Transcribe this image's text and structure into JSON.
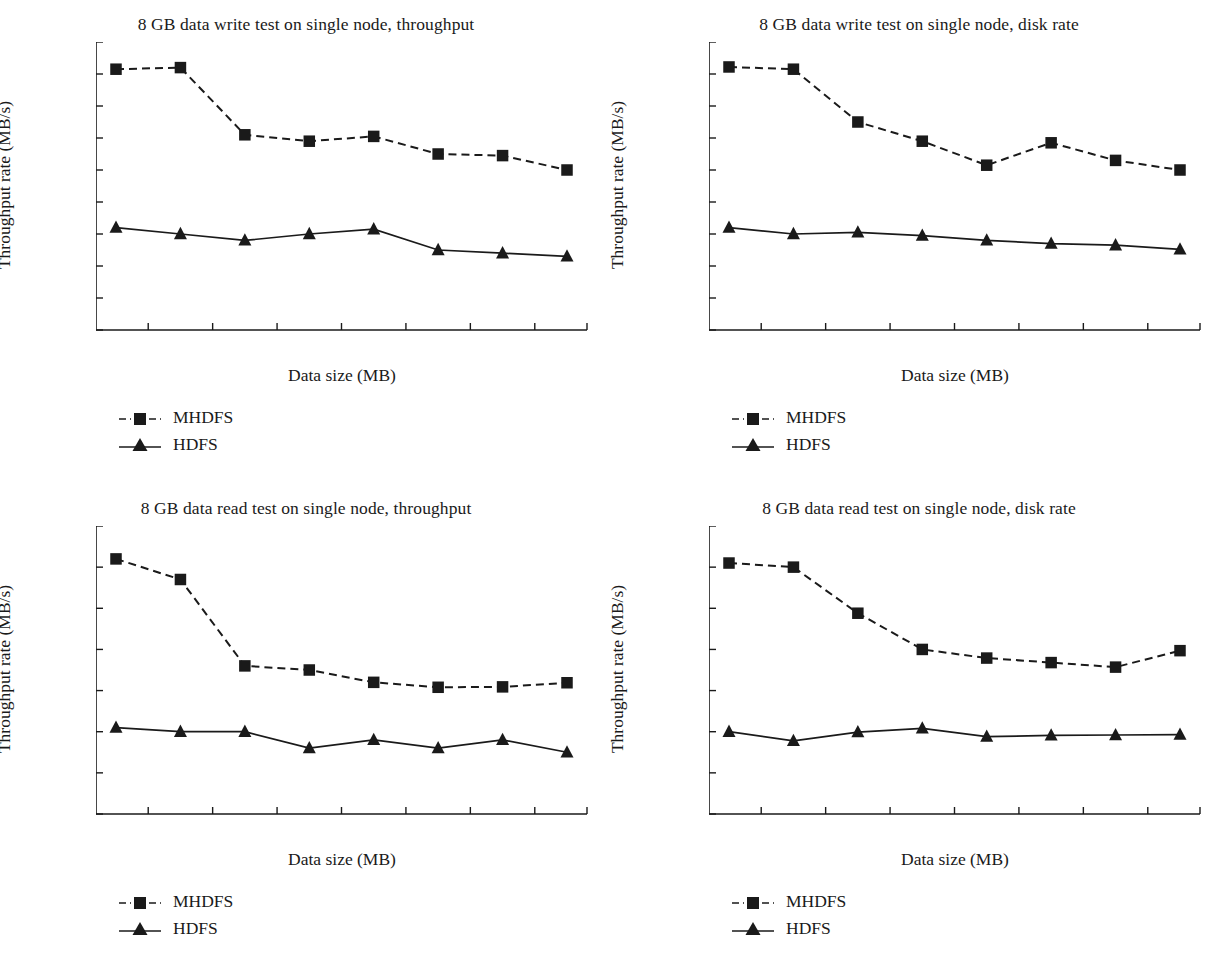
{
  "figure": {
    "background": "#ffffff",
    "ink": "#1a1a1a",
    "series_names": [
      "MHDFS",
      "HDFS"
    ]
  },
  "legend": {
    "mhdfs_label": "MHDFS",
    "hdfs_label": "HDFS",
    "mhdfs_style": "dashed-line-square-marker",
    "hdfs_style": "solid-line-triangle-marker"
  },
  "panels": [
    {
      "id": "top-left",
      "title": "8 GB data write test on single node, throughput",
      "xlabel": "Data size (MB)",
      "ylabel": "Throughput rate (MB/s)"
    },
    {
      "id": "top-right",
      "title": "8 GB data write test on single node, disk rate",
      "xlabel": "Data size (MB)",
      "ylabel": "Throughput rate (MB/s)"
    },
    {
      "id": "bottom-left",
      "title": "8 GB data read test on single node, throughput",
      "xlabel": "Data size (MB)",
      "ylabel": "Throughput rate (MB/s)"
    },
    {
      "id": "bottom-right",
      "title": "8 GB data read test on single node, disk rate",
      "xlabel": "Data size (MB)",
      "ylabel": "Throughput rate (MB/s)"
    }
  ],
  "chart_data": [
    {
      "type": "line",
      "panel": "top-left",
      "title": "8 GB data write test on single node, throughput",
      "xlabel": "Data size (MB)",
      "ylabel": "Throughput rate (MB/s)",
      "categories": [
        1000,
        2000,
        3000,
        4000,
        5000,
        6000,
        7000,
        8000
      ],
      "xtick_labels": [
        "1000",
        "2000",
        "3000",
        "4000",
        "5000",
        "6000",
        "7000",
        "8000"
      ],
      "ytick_labels": [
        "0",
        "100",
        "200",
        "300",
        "400",
        "500",
        "600",
        "700",
        "800",
        "900"
      ],
      "ylim": [
        0,
        900
      ],
      "ytick_step": 100,
      "grid": false,
      "legend_position": "below-left",
      "series": [
        {
          "name": "MHDFS",
          "style": "dashed",
          "marker": "square",
          "values": [
            815,
            820,
            610,
            590,
            605,
            550,
            545,
            500
          ]
        },
        {
          "name": "HDFS",
          "style": "solid",
          "marker": "triangle",
          "values": [
            320,
            300,
            280,
            300,
            315,
            250,
            240,
            230
          ]
        }
      ]
    },
    {
      "type": "line",
      "panel": "top-right",
      "title": "8 GB data write test on single node, disk rate",
      "xlabel": "Data size (MB)",
      "ylabel": "Throughput rate (MB/s)",
      "categories": [
        1000,
        2000,
        3000,
        4000,
        5000,
        6000,
        7000,
        8000
      ],
      "xtick_labels": [
        "1000",
        "2000",
        "3000",
        "4000",
        "5000",
        "6000",
        "7000",
        "8000"
      ],
      "ytick_labels": [
        "0",
        "100",
        "200",
        "300",
        "400",
        "500",
        "600",
        "700",
        "800",
        "900"
      ],
      "ylim": [
        0,
        900
      ],
      "ytick_step": 100,
      "grid": false,
      "legend_position": "below-left",
      "series": [
        {
          "name": "MHDFS",
          "style": "dashed",
          "marker": "square",
          "values": [
            822,
            815,
            650,
            590,
            515,
            585,
            530,
            500
          ]
        },
        {
          "name": "HDFS",
          "style": "solid",
          "marker": "triangle",
          "values": [
            320,
            300,
            305,
            295,
            280,
            270,
            265,
            252
          ]
        }
      ]
    },
    {
      "type": "line",
      "panel": "bottom-left",
      "title": "8 GB data read test on single node, throughput",
      "xlabel": "Data size (MB)",
      "ylabel": "Throughput rate (MB/s)",
      "categories": [
        1000,
        2000,
        3000,
        4000,
        5000,
        6000,
        7000,
        8000
      ],
      "xtick_labels": [
        "1000",
        "2000",
        "3000",
        "4000",
        "5000",
        "6000",
        "7000",
        "8000"
      ],
      "ytick_labels": [
        "0",
        "500",
        "1000",
        "1500",
        "2000",
        "2500",
        "3000",
        "3500"
      ],
      "ylim": [
        0,
        3500
      ],
      "ytick_step": 500,
      "grid": false,
      "legend_position": "below-left",
      "series": [
        {
          "name": "MHDFS",
          "style": "dashed",
          "marker": "square",
          "values": [
            3100,
            2850,
            1800,
            1750,
            1600,
            1540,
            1545,
            1595
          ]
        },
        {
          "name": "HDFS",
          "style": "solid",
          "marker": "triangle",
          "values": [
            1050,
            1000,
            1000,
            800,
            900,
            800,
            900,
            750
          ]
        }
      ]
    },
    {
      "type": "line",
      "panel": "bottom-right",
      "title": "8 GB data read test on single node, disk rate",
      "xlabel": "Data size (MB)",
      "ylabel": "Throughput rate (MB/s)",
      "categories": [
        1000,
        2000,
        3000,
        4000,
        5000,
        6000,
        7000,
        8000
      ],
      "xtick_labels": [
        "1000",
        "2000",
        "3000",
        "4000",
        "5000",
        "6000",
        "7000",
        "8000"
      ],
      "ytick_labels": [
        "0",
        "500",
        "1000",
        "1500",
        "2000",
        "2500",
        "3000",
        "3500"
      ],
      "ylim": [
        0,
        3500
      ],
      "ytick_step": 500,
      "grid": false,
      "legend_position": "below-left",
      "series": [
        {
          "name": "MHDFS",
          "style": "dashed",
          "marker": "square",
          "values": [
            3050,
            3000,
            2440,
            2000,
            1895,
            1840,
            1785,
            1985
          ]
        },
        {
          "name": "HDFS",
          "style": "solid",
          "marker": "triangle",
          "values": [
            1000,
            890,
            995,
            1040,
            940,
            955,
            960,
            965
          ]
        }
      ]
    }
  ]
}
